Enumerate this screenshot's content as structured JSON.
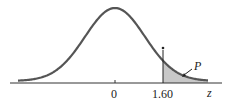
{
  "diagram": {
    "type": "standard normal curve with shaded right tail",
    "axis_label": "z",
    "tick_labels": [
      "0",
      "1.60"
    ],
    "critical_value": 1.6,
    "area_label": "P",
    "marker": "*",
    "colors": {
      "curve": "#555555",
      "shade": "#c8c8c8",
      "axis": "#333333"
    }
  }
}
